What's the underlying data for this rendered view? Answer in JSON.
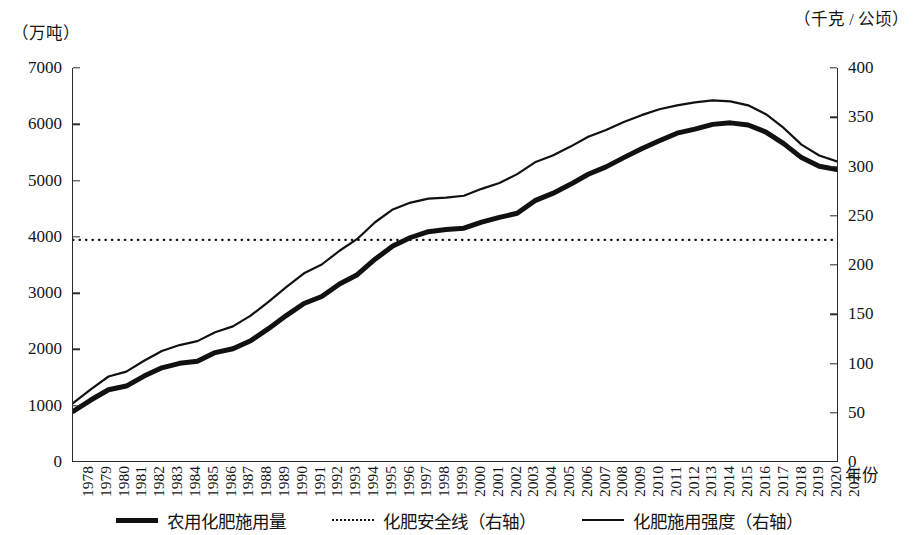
{
  "axes": {
    "left_unit": "（万吨）",
    "right_unit": "（千克 / 公顷）",
    "x_title": "年份"
  },
  "legend": {
    "items": [
      {
        "label": "农用化肥施用量",
        "style": "thick"
      },
      {
        "label": "化肥安全线（右轴）",
        "style": "dotted"
      },
      {
        "label": "化肥施用强度（右轴）",
        "style": "thin"
      }
    ]
  },
  "chart_data": {
    "type": "line",
    "title": "",
    "xlabel": "年份",
    "ylabel": "万吨",
    "y2label": "千克 / 公顷",
    "ylim": [
      0,
      7000
    ],
    "y2lim": [
      0,
      400
    ],
    "yticks": [
      0,
      1000,
      2000,
      3000,
      4000,
      5000,
      6000,
      7000
    ],
    "y2ticks": [
      0,
      50,
      100,
      150,
      200,
      250,
      300,
      350,
      400
    ],
    "grid": false,
    "legend_position": "bottom",
    "x": [
      1978,
      1979,
      1980,
      1981,
      1982,
      1983,
      1984,
      1985,
      1986,
      1987,
      1988,
      1989,
      1990,
      1991,
      1992,
      1993,
      1994,
      1995,
      1996,
      1997,
      1998,
      1999,
      2000,
      2001,
      2002,
      2003,
      2004,
      2005,
      2006,
      2007,
      2008,
      2009,
      2010,
      2011,
      2012,
      2013,
      2014,
      2015,
      2016,
      2017,
      2018,
      2019,
      2020,
      2021
    ],
    "series": [
      {
        "name": "农用化肥施用量",
        "axis": "left",
        "unit": "万吨",
        "style": "thick",
        "values": [
          884,
          1086,
          1269,
          1335,
          1513,
          1660,
          1740,
          1776,
          1931,
          1999,
          2142,
          2357,
          2590,
          2806,
          2930,
          3152,
          3318,
          3594,
          3828,
          3981,
          4084,
          4124,
          4146,
          4254,
          4339,
          4412,
          4637,
          4766,
          4928,
          5108,
          5239,
          5404,
          5562,
          5704,
          5839,
          5912,
          5996,
          6023,
          5984,
          5859,
          5653,
          5404,
          5251,
          5191
        ]
      },
      {
        "name": "化肥施用强度",
        "axis": "right",
        "unit": "千克 / 公顷",
        "style": "thin",
        "values": [
          59,
          73,
          86,
          91,
          102,
          112,
          118,
          122,
          131,
          137,
          148,
          162,
          177,
          191,
          200,
          214,
          226,
          243,
          256,
          263,
          267,
          268,
          270,
          277,
          283,
          292,
          304,
          311,
          320,
          330,
          337,
          345,
          352,
          358,
          362,
          365,
          367,
          366,
          362,
          353,
          339,
          322,
          311,
          305
        ]
      },
      {
        "name": "化肥安全线",
        "axis": "right",
        "unit": "千克 / 公顷",
        "style": "dotted",
        "constant": 225
      }
    ]
  }
}
